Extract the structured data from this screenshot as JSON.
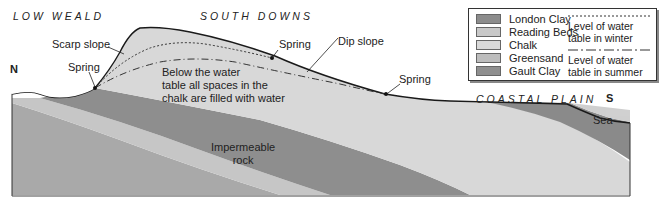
{
  "regions": {
    "low_weald": "LOW WEALD",
    "south_downs": "SOUTH DOWNS",
    "coastal_plain": "COASTAL PLAIN"
  },
  "compass": {
    "north": "N",
    "south": "S"
  },
  "labels": {
    "scarp_slope": "Scarp slope",
    "spring_left": "Spring",
    "spring_top": "Spring",
    "spring_right": "Spring",
    "dip_slope": "Dip slope",
    "sea": "Sea",
    "water_note_line1": "Below the water",
    "water_note_line2": "table all spaces in the",
    "water_note_line3": "chalk are filled with water",
    "impermeable_line1": "Impermeable",
    "impermeable_line2": "rock"
  },
  "legend": {
    "items": [
      {
        "label": "London Clay",
        "color": "#8c8c8c"
      },
      {
        "label": "Reading Beds",
        "color": "#c8c8c8"
      },
      {
        "label": "Chalk",
        "color": "#d9d9d9"
      },
      {
        "label": "Greensand",
        "color": "#bdbdbd"
      },
      {
        "label": "Gault Clay",
        "color": "#8f8f8f"
      }
    ],
    "winter_line1": "Level of water",
    "winter_line2": "table in winter",
    "summer_line1": "Level of water",
    "summer_line2": "table in summer"
  },
  "colors": {
    "chalk": "#d7d7d7",
    "gault_clay": "#8e8e8e",
    "greensand": "#c4c4c4",
    "lower_rock": "#a9a9a9",
    "london_clay": "#8a8a8a",
    "sea": "#cfcfcf",
    "outline": "#1a1a1a"
  }
}
